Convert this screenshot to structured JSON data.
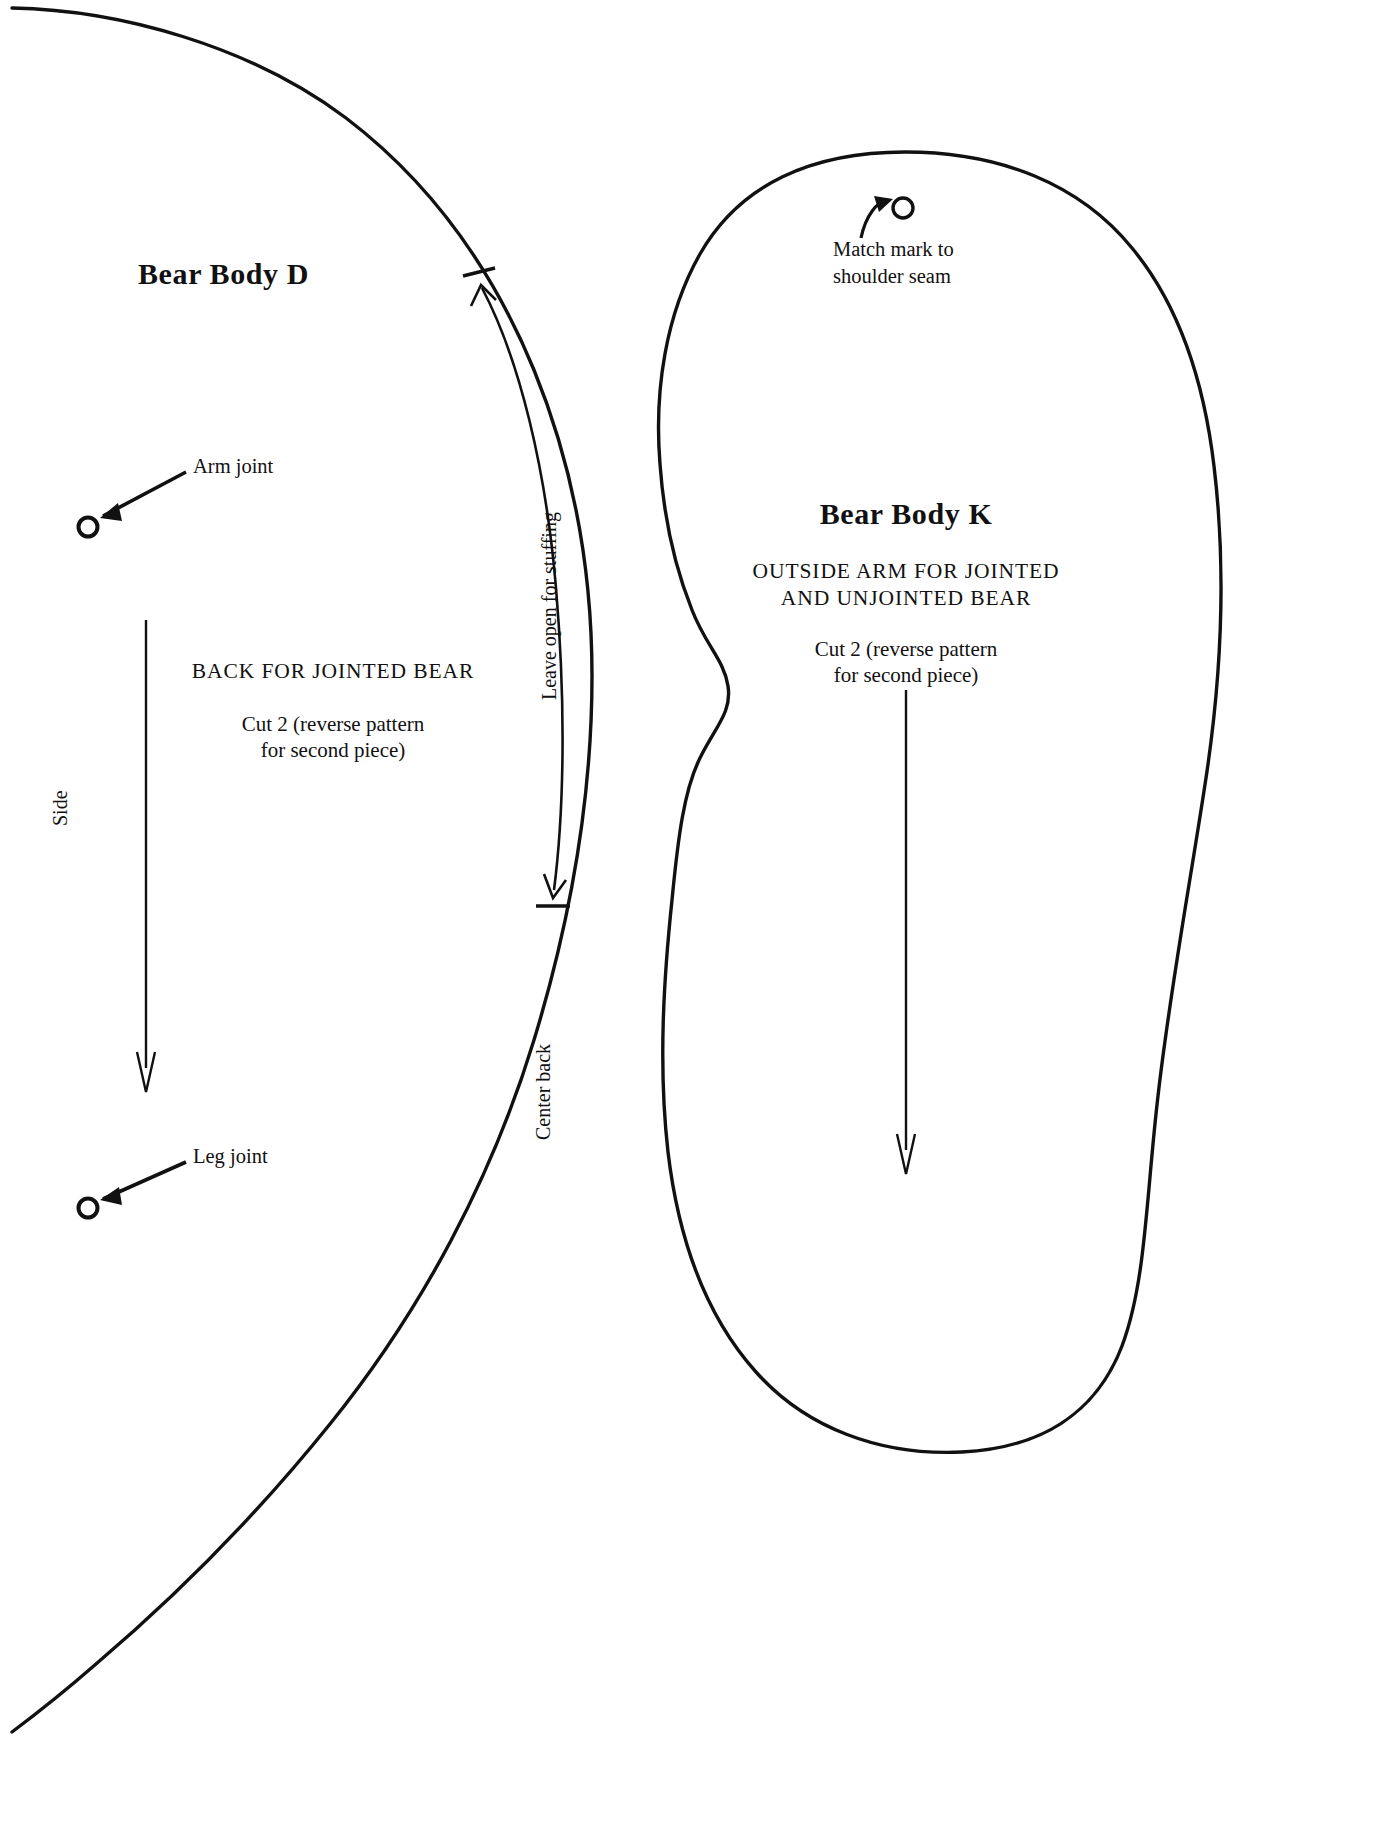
{
  "sheet": {
    "background": "#ffffff",
    "ink": "#111111",
    "width": 1389,
    "height": 1835
  },
  "pieces": [
    {
      "id": "bear-body-d",
      "title": "Bear Body D",
      "description_caps": "BACK FOR JOINTED BEAR",
      "cut_line_1": "Cut 2 (reverse pattern",
      "cut_line_2": "for second piece)",
      "markings": [
        {
          "name": "arm-joint",
          "label": "Arm joint"
        },
        {
          "name": "leg-joint",
          "label": "Leg joint"
        }
      ],
      "edge_labels": [
        {
          "name": "side",
          "label": "Side"
        },
        {
          "name": "center-back",
          "label": "Center back"
        },
        {
          "name": "leave-open",
          "label": "Leave open for stuffing"
        }
      ]
    },
    {
      "id": "bear-body-k",
      "title": "Bear Body K",
      "description_caps_1": "OUTSIDE ARM FOR JOINTED",
      "description_caps_2": "AND UNJOINTED BEAR",
      "cut_line_1": "Cut 2 (reverse pattern",
      "cut_line_2": "for second piece)",
      "markings": [
        {
          "name": "match-mark",
          "label_1": "Match mark to",
          "label_2": "shoulder seam"
        }
      ]
    }
  ]
}
